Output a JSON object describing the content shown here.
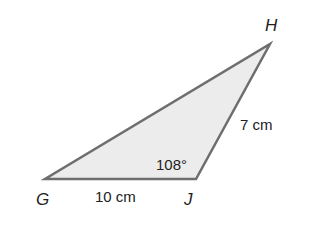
{
  "diagram": {
    "type": "triangle",
    "fill_color": "#ececec",
    "stroke_color": "#6e6e6e",
    "vertices": {
      "G": {
        "label": "G",
        "x": 45,
        "y": 179
      },
      "J": {
        "label": "J",
        "x": 196,
        "y": 179
      },
      "H": {
        "label": "H",
        "x": 270,
        "y": 44
      }
    },
    "measurements": {
      "side_GJ": "10 cm",
      "side_JH": "7 cm",
      "angle_J": "108°"
    }
  }
}
